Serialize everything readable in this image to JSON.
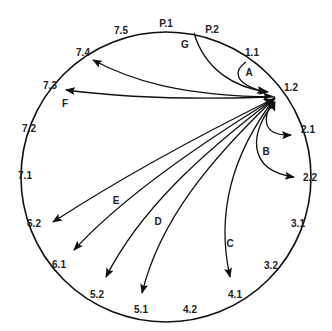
{
  "diagram": {
    "stroke_color": "#111111",
    "circle": {
      "cx": 166,
      "cy": 177,
      "r": 145
    },
    "node_labels": [
      {
        "id": "p1",
        "text": "P.1",
        "x": 166,
        "y": 23
      },
      {
        "id": "p2",
        "text": "P.2",
        "x": 212,
        "y": 29
      },
      {
        "id": "n11",
        "text": "1.1",
        "x": 252,
        "y": 52
      },
      {
        "id": "n12",
        "text": "1.2",
        "x": 291,
        "y": 87
      },
      {
        "id": "n21",
        "text": "2.1",
        "x": 308,
        "y": 129
      },
      {
        "id": "n22",
        "text": "2.2",
        "x": 310,
        "y": 177
      },
      {
        "id": "n31",
        "text": "3.1",
        "x": 298,
        "y": 223
      },
      {
        "id": "n32",
        "text": "3.2",
        "x": 271,
        "y": 265
      },
      {
        "id": "n41",
        "text": "4.1",
        "x": 235,
        "y": 294
      },
      {
        "id": "n42",
        "text": "4.2",
        "x": 190,
        "y": 309
      },
      {
        "id": "n51",
        "text": "5.1",
        "x": 141,
        "y": 309
      },
      {
        "id": "n52",
        "text": "5.2",
        "x": 97,
        "y": 294
      },
      {
        "id": "n61",
        "text": "6.1",
        "x": 59,
        "y": 264
      },
      {
        "id": "n62",
        "text": "6.2",
        "x": 34,
        "y": 223
      },
      {
        "id": "n71",
        "text": "7.1",
        "x": 25,
        "y": 175
      },
      {
        "id": "n72",
        "text": "7.2",
        "x": 29,
        "y": 128
      },
      {
        "id": "n73",
        "text": "7.3",
        "x": 50,
        "y": 85
      },
      {
        "id": "n74",
        "text": "7.4",
        "x": 83,
        "y": 52
      },
      {
        "id": "n75",
        "text": "7.5",
        "x": 121,
        "y": 30
      }
    ],
    "arc_labels": [
      {
        "id": "A",
        "text": "A",
        "x": 249,
        "y": 72
      },
      {
        "id": "B",
        "text": "B",
        "x": 266,
        "y": 151
      },
      {
        "id": "C",
        "text": "C",
        "x": 230,
        "y": 243
      },
      {
        "id": "D",
        "text": "D",
        "x": 158,
        "y": 221
      },
      {
        "id": "E",
        "text": "E",
        "x": 116,
        "y": 200
      },
      {
        "id": "F",
        "text": "F",
        "x": 65,
        "y": 103
      },
      {
        "id": "G",
        "text": "G",
        "x": 185,
        "y": 44
      }
    ],
    "edges": [
      {
        "label": "G",
        "from": "P.1",
        "to": "1.2"
      },
      {
        "label": "A",
        "from": "1.1",
        "to": "1.2"
      },
      {
        "label": "",
        "from": "1.2",
        "to": "7.4"
      },
      {
        "label": "F",
        "from": "1.2",
        "to": "7.3",
        "bidirectional": true
      },
      {
        "label": "B",
        "from": "1.2",
        "to": "2.1"
      },
      {
        "label": "B",
        "from": "1.2",
        "to": "2.2"
      },
      {
        "label": "C",
        "from": "1.2",
        "to": "4.1"
      },
      {
        "label": "D",
        "from": "1.2",
        "to": "5.1"
      },
      {
        "label": "D",
        "from": "1.2",
        "to": "5.2"
      },
      {
        "label": "E",
        "from": "1.2",
        "to": "6.1"
      },
      {
        "label": "E",
        "from": "1.2",
        "to": "6.2"
      }
    ]
  }
}
